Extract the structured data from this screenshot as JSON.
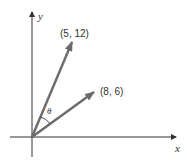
{
  "diagram": {
    "title": "",
    "axes": {
      "x_label": "x",
      "y_label": "y",
      "axis_color": "#333333"
    },
    "vectors": [
      {
        "label": "(5, 12)",
        "x": 5,
        "y": 12,
        "color": "#6b6b6b"
      },
      {
        "label": "(8, 6)",
        "x": 8,
        "y": 6,
        "color": "#6b6b6b"
      }
    ],
    "angle": {
      "label": "θ",
      "between": [
        "(5, 12)",
        "(8, 6)"
      ]
    }
  }
}
